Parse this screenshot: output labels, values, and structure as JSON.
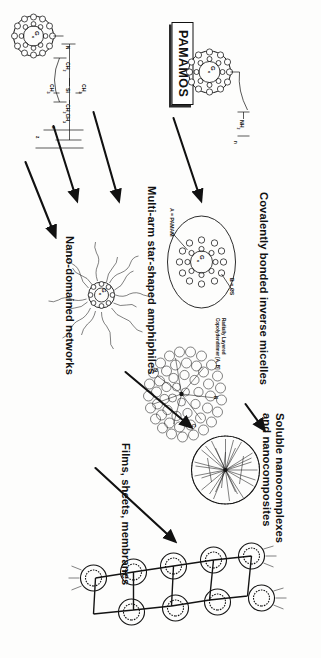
{
  "figure": {
    "title_box": {
      "label": "PAMAMOS"
    },
    "pathway_labels": [
      {
        "id": "covalently-bonded-inverse-micelles",
        "text": "Covalently bonded inverse micelles"
      },
      {
        "id": "soluble-nanocomplexes-and-nanocomposites",
        "line1": "Soluble nanocomplexes",
        "line2": "and nanocomposites"
      },
      {
        "id": "multi-arm-star-shaped-amphiphiles",
        "text": "Multi-arm star-shaped amphiphiles"
      },
      {
        "id": "films-sheets-membranes",
        "text": "Films, sheets, membranes"
      },
      {
        "id": "nano-domained-networks",
        "text": "Nano-domained networks"
      }
    ],
    "annotations": {
      "component_a": "A = PAMAM",
      "component_b": "B = OS",
      "copolymer": {
        "line1": "Radially Layered",
        "line2": "Copolydendrimer [A, B]"
      }
    },
    "structures": {
      "precursor_amine": {
        "core": "G",
        "core_sub": "x",
        "terminal": "NH",
        "terminal_sub": "2",
        "repeat": "n"
      },
      "precursor_silane": {
        "core": "G",
        "core_sub": "x",
        "bracket_open": "[",
        "bracket_close": "]",
        "chain_head": "N",
        "chain_1": "CH",
        "chain_1_sub": "2",
        "si_label": "Si",
        "me_top": "CH",
        "me_top_sub": "3",
        "me_bot": "CH",
        "me_bot_sub": "3",
        "tail": "CH",
        "tail_sub": "2",
        "tail2": "CH",
        "tail2_sub": "3",
        "sub_a": "a",
        "sub_z": "z"
      },
      "inverse_micelle": {
        "core": "G",
        "core_sub": "x"
      },
      "star_amphiphile": {
        "core": "G",
        "core_sub": "x",
        "arms": 14
      },
      "nano_domained": {
        "label_n": "N",
        "label_si": "Si",
        "label_c": "C"
      },
      "nanocomplex": {
        "shell": "spiky-shell"
      },
      "network_sheet": {
        "node_count": 9
      }
    },
    "arrows": [
      {
        "id": "arrow-to-inverse-micelles"
      },
      {
        "id": "arrow-to-star-amphiphiles"
      },
      {
        "id": "arrow-to-nano-domained"
      },
      {
        "id": "arrow-to-nanocomplexes"
      },
      {
        "id": "arrow-to-soluble-from-star"
      },
      {
        "id": "arrow-to-films-sheets"
      }
    ],
    "colors": {
      "ink": "#141414",
      "paper": "#fdfdfc"
    }
  }
}
